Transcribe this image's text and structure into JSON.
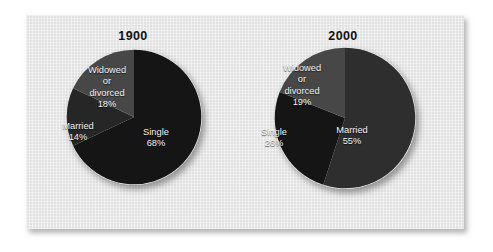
{
  "figure": {
    "panel_background": "#e9e9e9",
    "page_background": "#ffffff"
  },
  "colors": {
    "single_dark": "#151515",
    "married_mid": "#262626",
    "widowed_light": "#474747",
    "married_2000": "#2e2e2e",
    "label_text": "#f2f2f2",
    "title_text": "#111111"
  },
  "charts": [
    {
      "id": "1900",
      "title": "1900",
      "labels": {
        "widowed": {
          "name_line1": "Widowed",
          "name_line2": "or",
          "name_line3": "divorced",
          "value": "18%"
        },
        "married": {
          "name": "Married",
          "value": "14%"
        },
        "single": {
          "name": "Single",
          "value": "68%"
        }
      }
    },
    {
      "id": "2000",
      "title": "2000",
      "labels": {
        "widowed": {
          "name_line1": "Widowed",
          "name_line2": "or",
          "name_line3": "divorced",
          "value": "19%"
        },
        "single": {
          "name": "Single",
          "value": "26%"
        },
        "married": {
          "name": "Married",
          "value": "55%"
        }
      }
    }
  ],
  "chart_data": [
    {
      "type": "pie",
      "title": "1900",
      "xlabel": "",
      "ylabel": "",
      "legend_position": "none",
      "grid": false,
      "units": "percent",
      "start_angle_deg": 0,
      "direction": "clockwise",
      "categories": [
        "Single",
        "Married",
        "Widowed or divorced"
      ],
      "values": [
        68,
        14,
        18
      ],
      "slices": [
        {
          "label": "Single",
          "value": 68,
          "value_label": "68%",
          "color": "#151515",
          "start_deg": 0,
          "sweep_deg": 244.8
        },
        {
          "label": "Married",
          "value": 14,
          "value_label": "14%",
          "color": "#262626",
          "start_deg": 244.8,
          "sweep_deg": 50.4
        },
        {
          "label": "Widowed or divorced",
          "value": 18,
          "value_label": "18%",
          "color": "#474747",
          "start_deg": 295.2,
          "sweep_deg": 64.8
        }
      ]
    },
    {
      "type": "pie",
      "title": "2000",
      "xlabel": "",
      "ylabel": "",
      "legend_position": "none",
      "grid": false,
      "units": "percent",
      "start_angle_deg": 0,
      "direction": "clockwise",
      "categories": [
        "Married",
        "Single",
        "Widowed or divorced"
      ],
      "values": [
        55,
        26,
        19
      ],
      "slices": [
        {
          "label": "Married",
          "value": 55,
          "value_label": "55%",
          "color": "#2e2e2e",
          "start_deg": 0,
          "sweep_deg": 198.0
        },
        {
          "label": "Single",
          "value": 26,
          "value_label": "26%",
          "color": "#151515",
          "start_deg": 198.0,
          "sweep_deg": 93.6
        },
        {
          "label": "Widowed or divorced",
          "value": 19,
          "value_label": "19%",
          "color": "#474747",
          "start_deg": 291.6,
          "sweep_deg": 68.4
        }
      ]
    }
  ]
}
